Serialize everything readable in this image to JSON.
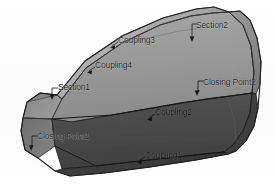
{
  "viewport": {
    "title": "3D loft preview",
    "background_color": "#ffffff",
    "width": 274,
    "height": 190
  },
  "model": {
    "name": "lofted-transition-solid",
    "description": "Tapered lofted solid between a polygonal section and a rounded section",
    "colors": {
      "top_face": "#a9a9a9",
      "upper_side_face": "#9a9a9a",
      "lower_side_face": "#4a4a4a",
      "left_cap_face": "#8e8e8e",
      "left_cap_lower": "#7c7c7c",
      "right_cap_face": "#8a8a8a",
      "right_cap_lower": "#3f3f3f",
      "bottom_face": "#3a3a3a",
      "edge_line": "#1c1c1c",
      "guide_line": "#9fb0a6"
    }
  },
  "annotations": [
    {
      "id": "section2",
      "label": "Section2",
      "x": 196,
      "y": 26,
      "leader": "down-left"
    },
    {
      "id": "coupling3",
      "label": "Coupling3",
      "x": 118,
      "y": 41,
      "leader": "left-tick"
    },
    {
      "id": "coupling4",
      "label": "Coupling4",
      "x": 95,
      "y": 66,
      "leader": "left-tick"
    },
    {
      "id": "section1",
      "label": "Section1",
      "x": 58,
      "y": 88,
      "leader": "left-tick"
    },
    {
      "id": "closing-point2",
      "label": "Closing Point2",
      "x": 203,
      "y": 83,
      "leader": "down-left"
    },
    {
      "id": "coupling2",
      "label": "Coupling2",
      "x": 155,
      "y": 113,
      "leader": "left-tick"
    },
    {
      "id": "closing-point1",
      "label": "Closing Point1",
      "x": 37,
      "y": 137,
      "leader": "down-left"
    },
    {
      "id": "coupling1",
      "label": "Coupling1",
      "x": 145,
      "y": 156,
      "leader": "left-tick"
    }
  ]
}
